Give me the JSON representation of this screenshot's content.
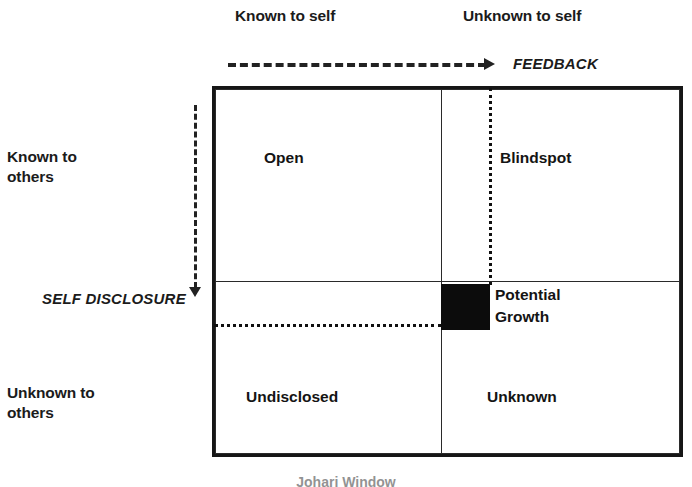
{
  "diagram": {
    "title": "Johari Window",
    "caption": "Johari Window",
    "column_headers": {
      "left": "Known to self",
      "right": "Unknown to self"
    },
    "row_headers": {
      "top_line1": "Known to",
      "top_line2": "others",
      "bottom_line1": "Unknown to",
      "bottom_line2": "others"
    },
    "axes": {
      "feedback": "FEEDBACK",
      "self_disclosure": "SELF DISCLOSURE"
    },
    "quadrants": {
      "open": "Open",
      "blindspot": "Blindspot",
      "undisclosed": "Undisclosed",
      "unknown": "Unknown"
    },
    "growth": {
      "line1": "Potential",
      "line2": "Growth"
    },
    "colors": {
      "ink": "#161616",
      "fill": "#0c0c0c",
      "background": "#ffffff",
      "rule": "#2a2a2a"
    }
  }
}
